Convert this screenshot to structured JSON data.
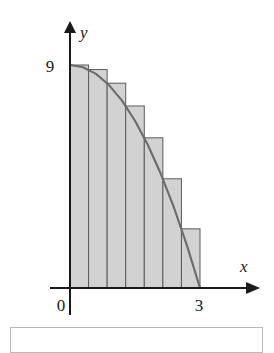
{
  "figure": {
    "name": "riemann-sum-left-endpoint-rectangles",
    "axes": {
      "x_axis_label": "x",
      "y_axis_label": "y",
      "origin_label": "0",
      "x_tick_label": "3",
      "y_tick_label": "9"
    }
  },
  "chart_data": {
    "type": "bar",
    "title": "",
    "xlabel": "x",
    "ylabel": "y",
    "xlim": [
      0,
      3
    ],
    "ylim": [
      0,
      9
    ],
    "grid": false,
    "legend": null,
    "xticks": [
      0,
      3
    ],
    "xticklabels": [
      "0",
      "3"
    ],
    "yticks": [
      9
    ],
    "yticklabels": [
      "9"
    ],
    "annotations": [],
    "rectangles": {
      "count": 7,
      "rule": "left endpoint",
      "width": 0.42857,
      "x_left": [
        0.0,
        0.42857,
        0.85714,
        1.28571,
        1.71429,
        2.14286,
        2.57143
      ],
      "x_right": [
        0.42857,
        0.85714,
        1.28571,
        1.71429,
        2.14286,
        2.57143,
        3.0
      ],
      "heights": [
        9.0,
        8.8163,
        8.2653,
        7.3469,
        6.0612,
        4.4082,
        2.3878
      ]
    },
    "curve": {
      "equation": "y = 9 - x^2",
      "x": [
        0.0,
        0.3,
        0.6,
        0.9,
        1.2,
        1.5,
        1.8,
        2.1,
        2.4,
        2.7,
        3.0
      ],
      "y": [
        9.0,
        8.91,
        8.64,
        8.19,
        7.56,
        6.75,
        5.76,
        4.59,
        3.24,
        1.71,
        0.0
      ]
    },
    "style": {
      "bar_fill": "#d2d2d2",
      "bar_stroke": "#5a5a5a",
      "curve_color": "#6b6b6b",
      "axis_color": "#1a1a1a"
    }
  },
  "caption": {
    "text": ""
  }
}
